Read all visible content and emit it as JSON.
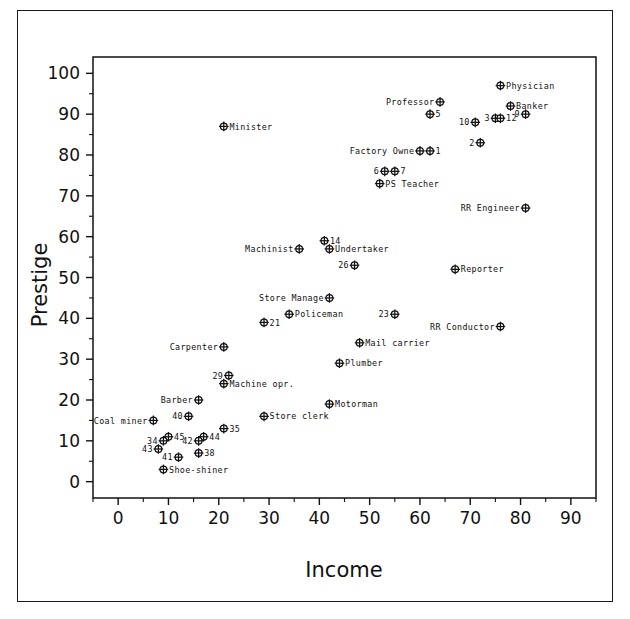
{
  "figure": {
    "background": "#ffffff",
    "ink": "#111111",
    "marker_style": "circle-plus",
    "has_outer_frame": true
  },
  "chart_data": {
    "type": "scatter",
    "title": "",
    "xlabel": "Income",
    "ylabel": "Prestige",
    "xlim": [
      -5,
      95
    ],
    "ylim": [
      -4,
      104
    ],
    "grid": false,
    "legend": "none",
    "xticks": [
      0,
      10,
      20,
      30,
      40,
      50,
      60,
      70,
      80,
      90
    ],
    "xticklabels": [
      "0",
      "10",
      "20",
      "30",
      "40",
      "50",
      "60",
      "70",
      "80",
      "90"
    ],
    "xminor_step": 5,
    "yticks": [
      0,
      10,
      20,
      30,
      40,
      50,
      60,
      70,
      80,
      90,
      100
    ],
    "yticklabels": [
      "0",
      "10",
      "20",
      "30",
      "40",
      "50",
      "60",
      "70",
      "80",
      "90",
      "100"
    ],
    "yminor_step": 5,
    "points": [
      {
        "label": "Physician",
        "x": 76,
        "y": 97,
        "pos": "right"
      },
      {
        "label": "Professor",
        "x": 64,
        "y": 93,
        "pos": "left"
      },
      {
        "label": "Banker",
        "x": 78,
        "y": 92,
        "pos": "right"
      },
      {
        "label": "5",
        "x": 62,
        "y": 90,
        "pos": "right"
      },
      {
        "label": "9",
        "x": 81,
        "y": 90,
        "pos": "left"
      },
      {
        "label": "3",
        "x": 75,
        "y": 89,
        "pos": "left"
      },
      {
        "label": "12",
        "x": 76,
        "y": 89,
        "pos": "right"
      },
      {
        "label": "10",
        "x": 71,
        "y": 88,
        "pos": "left"
      },
      {
        "label": "Minister",
        "x": 21,
        "y": 87,
        "pos": "right"
      },
      {
        "label": "2",
        "x": 72,
        "y": 83,
        "pos": "left"
      },
      {
        "label": "1",
        "x": 62,
        "y": 81,
        "pos": "right"
      },
      {
        "label": "Factory Owne",
        "x": 60,
        "y": 81,
        "pos": "left"
      },
      {
        "label": "7",
        "x": 55,
        "y": 76,
        "pos": "right"
      },
      {
        "label": "6",
        "x": 53,
        "y": 76,
        "pos": "left"
      },
      {
        "label": "PS Teacher",
        "x": 52,
        "y": 73,
        "pos": "right"
      },
      {
        "label": "RR Engineer",
        "x": 81,
        "y": 67,
        "pos": "left"
      },
      {
        "label": "14",
        "x": 41,
        "y": 59,
        "pos": "right"
      },
      {
        "label": "Undertaker",
        "x": 42,
        "y": 57,
        "pos": "right"
      },
      {
        "label": "Machinist",
        "x": 36,
        "y": 57,
        "pos": "left"
      },
      {
        "label": "26",
        "x": 47,
        "y": 53,
        "pos": "left"
      },
      {
        "label": "Reporter",
        "x": 67,
        "y": 52,
        "pos": "right"
      },
      {
        "label": "Store Manage",
        "x": 42,
        "y": 45,
        "pos": "left"
      },
      {
        "label": "Policeman",
        "x": 34,
        "y": 41,
        "pos": "right"
      },
      {
        "label": "23",
        "x": 55,
        "y": 41,
        "pos": "left"
      },
      {
        "label": "21",
        "x": 29,
        "y": 39,
        "pos": "right"
      },
      {
        "label": "RR Conductor",
        "x": 76,
        "y": 38,
        "pos": "left"
      },
      {
        "label": "Mail carrier",
        "x": 48,
        "y": 34,
        "pos": "right"
      },
      {
        "label": "Carpenter",
        "x": 21,
        "y": 33,
        "pos": "left"
      },
      {
        "label": "Plumber",
        "x": 44,
        "y": 29,
        "pos": "right"
      },
      {
        "label": "29",
        "x": 22,
        "y": 26,
        "pos": "left"
      },
      {
        "label": "Machine opr.",
        "x": 21,
        "y": 24,
        "pos": "right"
      },
      {
        "label": "Barber",
        "x": 16,
        "y": 20,
        "pos": "left"
      },
      {
        "label": "Motorman",
        "x": 42,
        "y": 19,
        "pos": "right"
      },
      {
        "label": "40",
        "x": 14,
        "y": 16,
        "pos": "left"
      },
      {
        "label": "Store clerk",
        "x": 29,
        "y": 16,
        "pos": "right"
      },
      {
        "label": "Coal miner",
        "x": 7,
        "y": 15,
        "pos": "left"
      },
      {
        "label": "35",
        "x": 21,
        "y": 13,
        "pos": "right"
      },
      {
        "label": "45",
        "x": 10,
        "y": 11,
        "pos": "right"
      },
      {
        "label": "44",
        "x": 17,
        "y": 11,
        "pos": "right"
      },
      {
        "label": "34",
        "x": 9,
        "y": 10,
        "pos": "left"
      },
      {
        "label": "42",
        "x": 16,
        "y": 10,
        "pos": "left"
      },
      {
        "label": "43",
        "x": 8,
        "y": 8,
        "pos": "left"
      },
      {
        "label": "38",
        "x": 16,
        "y": 7,
        "pos": "right"
      },
      {
        "label": "41",
        "x": 12,
        "y": 6,
        "pos": "left"
      },
      {
        "label": "Shoe-shiner",
        "x": 9,
        "y": 3,
        "pos": "right"
      }
    ]
  }
}
